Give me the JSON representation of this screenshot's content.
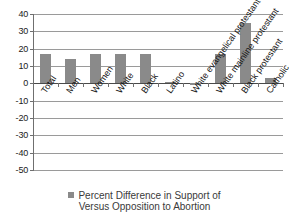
{
  "chart_data": {
    "type": "bar",
    "title": "",
    "xlabel": "",
    "ylabel": "",
    "ylim": [
      -50,
      40
    ],
    "ytick_step": 10,
    "grid": true,
    "legend_position": "bottom",
    "series_name": "Percent Difference in Support of Versus Opposition to Abortion",
    "categories": [
      "Total",
      "Men",
      "Women",
      "White",
      "Black",
      "Latino",
      "White evangelical protestant",
      "White mainline protestant",
      "Black protestant",
      "Catholic"
    ],
    "values": [
      17,
      14,
      17,
      17,
      17,
      1,
      -1,
      17,
      35,
      3
    ],
    "ytick_labels": [
      "40",
      "30",
      "20",
      "10",
      "0",
      "-10",
      "-20",
      "-30",
      "-40",
      "-50"
    ],
    "bar_color": "#8a8a8a",
    "axis_color": "#6f6f6f",
    "grid_color": "#9a9a9a"
  },
  "legend": {
    "line1": "Percent Difference in Support of",
    "line2": "Versus Opposition to Abortion",
    "marker": "square-marker"
  }
}
